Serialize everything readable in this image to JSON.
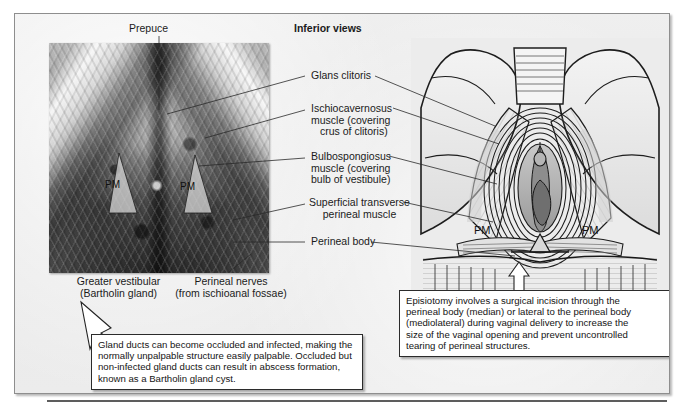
{
  "page": {
    "heading": "Inferior views"
  },
  "photo": {
    "top_label": "Prepuce",
    "markers": [
      {
        "id": "pm-left",
        "text": "PM"
      },
      {
        "id": "pm-right",
        "text": "PM"
      }
    ],
    "bottom_labels": [
      {
        "line1": "Greater vestibular",
        "line2": "(Bartholin gland)"
      },
      {
        "line1": "Perineal nerves",
        "line2": "(from ischioanal fossae)"
      }
    ]
  },
  "center_labels": [
    {
      "id": "glans-clitoris",
      "lines": [
        "Glans clitoris"
      ]
    },
    {
      "id": "ischiocavernosus",
      "lines": [
        "Ischiocavernosus",
        "muscle (covering",
        "crus of clitoris)"
      ]
    },
    {
      "id": "bulbospongiosus",
      "lines": [
        "Bulbospongiosus",
        "muscle (covering",
        "bulb of vestibule)"
      ]
    },
    {
      "id": "superficial-transverse-perineal",
      "lines": [
        "Superficial transverse",
        "perineal muscle"
      ]
    },
    {
      "id": "perineal-body",
      "lines": [
        "Perineal body"
      ]
    }
  ],
  "illustration": {
    "markers": [
      {
        "id": "pm-left",
        "text": "PM"
      },
      {
        "id": "pm-right",
        "text": "PM"
      }
    ]
  },
  "callouts": {
    "bartholin": {
      "lines": [
        "Gland ducts can become occluded and infected, making the",
        "normally unpalpable structure easily palpable. Occluded but",
        "non-infected gland ducts can result in abscess formation,",
        "known as a Bartholin gland cyst."
      ]
    },
    "episiotomy": {
      "lines": [
        "Episiotomy involves a surgical incision through the",
        "perineal body (median) or lateral to the perineal body",
        "(mediolateral) during vaginal delivery to increase the",
        "size of the vaginal opening and prevent uncontrolled",
        "tearing of perineal structures."
      ]
    }
  },
  "colors": {
    "page_background": "#ffffff",
    "plate_background": "#e9e9e9",
    "plate_border": "#8e8e8e",
    "text": "#141414",
    "callout_background": "#ffffff",
    "callout_border": "#2b2b2b",
    "leader_line": "#2a2a2a",
    "rule": "#5d5d5d"
  }
}
